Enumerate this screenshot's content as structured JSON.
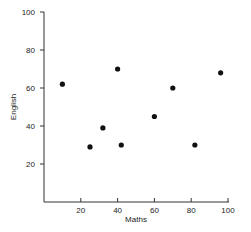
{
  "chart_data": {
    "type": "scatter",
    "title": "",
    "xlabel": "Maths",
    "ylabel": "English",
    "xlim": [
      0,
      100
    ],
    "ylim": [
      0,
      100
    ],
    "xticks": [
      20,
      40,
      60,
      80,
      100
    ],
    "yticks": [
      20,
      40,
      60,
      80,
      100
    ],
    "grid": false,
    "legend": null,
    "points": [
      {
        "x": 10,
        "y": 62
      },
      {
        "x": 25,
        "y": 29
      },
      {
        "x": 32,
        "y": 39
      },
      {
        "x": 40,
        "y": 70
      },
      {
        "x": 42,
        "y": 30
      },
      {
        "x": 60,
        "y": 45
      },
      {
        "x": 70,
        "y": 60
      },
      {
        "x": 82,
        "y": 30
      },
      {
        "x": 96,
        "y": 68
      }
    ],
    "marker_color": "#111111"
  }
}
